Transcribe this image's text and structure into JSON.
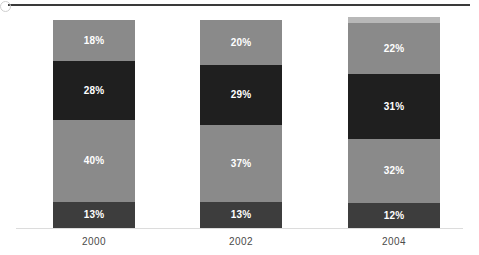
{
  "chart_data": {
    "type": "bar",
    "subtype": "stacked-100-percent",
    "title": "",
    "subtitle": "",
    "xlabel": "",
    "ylabel": "",
    "grid": false,
    "legend": "none",
    "ylim": [
      0,
      100
    ],
    "value_suffix": "%",
    "orientation": "vertical",
    "categories": [
      "2000",
      "2002",
      "2004"
    ],
    "series": [
      {
        "name": "segment-bottom",
        "color": "#3d3d3d",
        "values": [
          13,
          13,
          12
        ]
      },
      {
        "name": "segment-lower-middle",
        "color": "#8a8a8a",
        "values": [
          40,
          37,
          32
        ]
      },
      {
        "name": "segment-upper-middle",
        "color": "#1f1f1f",
        "values": [
          28,
          29,
          31
        ]
      },
      {
        "name": "segment-top",
        "color": "#8a8a8a",
        "values": [
          18,
          20,
          22
        ]
      }
    ],
    "bars": [
      {
        "category": "2000",
        "x": 53,
        "width": 82,
        "top_cap": null,
        "segments": [
          {
            "name": "segment-top",
            "label": "18%",
            "value": 18,
            "color": "#8a8a8a",
            "height": 41
          },
          {
            "name": "segment-upper-middle",
            "label": "28%",
            "value": 28,
            "color": "#1f1f1f",
            "height": 59
          },
          {
            "name": "segment-lower-middle",
            "label": "40%",
            "value": 40,
            "color": "#8a8a8a",
            "height": 82
          },
          {
            "name": "segment-bottom",
            "label": "13%",
            "value": 13,
            "color": "#3d3d3d",
            "height": 26
          }
        ]
      },
      {
        "category": "2002",
        "x": 200,
        "width": 82,
        "top_cap": null,
        "segments": [
          {
            "name": "segment-top",
            "label": "20%",
            "value": 20,
            "color": "#8a8a8a",
            "height": 45
          },
          {
            "name": "segment-upper-middle",
            "label": "29%",
            "value": 29,
            "color": "#1f1f1f",
            "height": 60
          },
          {
            "name": "segment-lower-middle",
            "label": "37%",
            "value": 37,
            "color": "#8a8a8a",
            "height": 77
          },
          {
            "name": "segment-bottom",
            "label": "13%",
            "value": 13,
            "color": "#3d3d3d",
            "height": 26
          }
        ]
      },
      {
        "category": "2004",
        "x": 348,
        "width": 92,
        "top_cap": {
          "name": "segment-cap",
          "color": "#b8b8b8",
          "height": 6
        },
        "segments": [
          {
            "name": "segment-top",
            "label": "22%",
            "value": 22,
            "color": "#8a8a8a",
            "height": 51
          },
          {
            "name": "segment-upper-middle",
            "label": "31%",
            "value": 31,
            "color": "#1f1f1f",
            "height": 65
          },
          {
            "name": "segment-lower-middle",
            "label": "32%",
            "value": 32,
            "color": "#8a8a8a",
            "height": 64
          },
          {
            "name": "segment-bottom",
            "label": "12%",
            "value": 12,
            "color": "#3d3d3d",
            "height": 25
          }
        ]
      }
    ],
    "category_label_positions": [
      {
        "label": "2000",
        "x": 53,
        "width": 82
      },
      {
        "label": "2002",
        "x": 200,
        "width": 82
      },
      {
        "label": "2004",
        "x": 348,
        "width": 92
      }
    ],
    "colors": {
      "background": "#ffffff",
      "top_rule": "#3a3a3a",
      "axis_line": "#dcdcdc",
      "label_text": "#4a4a4a",
      "value_text": "#ffffff"
    }
  }
}
